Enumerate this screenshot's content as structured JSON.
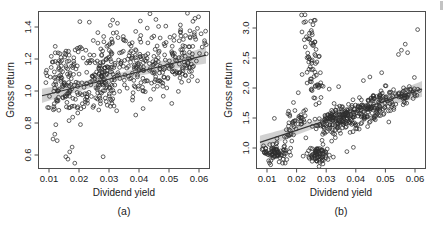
{
  "figure": {
    "title": "",
    "background_color": "#ffffff",
    "point_color": "#2e2e2e",
    "line_color": "#333333",
    "band_color": "#9a9a9a"
  },
  "chart_data": [
    {
      "type": "scatter",
      "panel": "a",
      "caption": "(a)",
      "title": "",
      "xlabel": "Dividend yield",
      "ylabel": "Gross return",
      "xlim": [
        0.0085,
        0.0655
      ],
      "ylim": [
        0.53,
        1.5
      ],
      "xticks": [
        0.01,
        0.02,
        0.03,
        0.04,
        0.05,
        0.06
      ],
      "xticklabels": [
        "0.01",
        "0.02",
        "0.03",
        "0.04",
        "0.05",
        "0.06"
      ],
      "yticks": [
        0.6,
        0.8,
        1.0,
        1.2,
        1.4
      ],
      "yticklabels": [
        "0.6",
        "0.8",
        "1.0",
        "1.2",
        "1.4"
      ],
      "grid": false,
      "legend": "none",
      "fit": {
        "type": "linear-regression",
        "intercept": 0.935,
        "slope": 4.6,
        "x_start": 0.0095,
        "x_end": 0.0645,
        "y_start": 0.979,
        "y_end": 1.232,
        "ci_halfwidth_start": 0.022,
        "ci_halfwidth_end": 0.052
      },
      "n_points": 520,
      "x": [
        0.0108,
        0.0112,
        0.0115,
        0.0118,
        0.0121,
        0.0124,
        0.0126,
        0.0128,
        0.0131,
        0.0133,
        0.0135,
        0.0137,
        0.0139,
        0.0141,
        0.0143,
        0.0145,
        0.0147,
        0.0149,
        0.0151,
        0.0153,
        0.0155,
        0.0157,
        0.0159,
        0.0161,
        0.0163,
        0.0165,
        0.0167,
        0.0169,
        0.0171,
        0.0173,
        0.0175,
        0.0176,
        0.0178,
        0.018,
        0.0182,
        0.0184,
        0.0186,
        0.0188,
        0.019,
        0.0192,
        0.0194,
        0.0196,
        0.0198,
        0.02,
        0.0202,
        0.0204,
        0.0206,
        0.0208,
        0.021,
        0.0212,
        0.0214,
        0.0216,
        0.0218,
        0.022,
        0.0222,
        0.0224,
        0.0226,
        0.0228,
        0.023,
        0.0232,
        0.0234,
        0.0236,
        0.0238,
        0.024,
        0.0242,
        0.0244,
        0.0246,
        0.0248,
        0.025,
        0.0252,
        0.0254,
        0.0256,
        0.0258,
        0.026,
        0.0262,
        0.0264,
        0.0266,
        0.0268,
        0.027,
        0.0272,
        0.0274,
        0.0276,
        0.0278,
        0.028,
        0.0282,
        0.0284,
        0.0286,
        0.0288,
        0.029,
        0.0292,
        0.0294,
        0.0296,
        0.0298,
        0.03,
        0.0302,
        0.0304,
        0.0306,
        0.0308,
        0.031,
        0.0312,
        0.0314,
        0.0316,
        0.0318,
        0.032,
        0.0322,
        0.0324,
        0.0326,
        0.0328,
        0.033,
        0.0332,
        0.0334,
        0.0336,
        0.0338,
        0.034,
        0.0342,
        0.0344,
        0.0346,
        0.0348,
        0.035,
        0.0352,
        0.0354,
        0.0356,
        0.0358,
        0.036,
        0.0362,
        0.0364,
        0.0366,
        0.0368,
        0.037,
        0.0372,
        0.0374,
        0.0376,
        0.0378,
        0.038,
        0.0383,
        0.0386,
        0.0389,
        0.0392,
        0.0395,
        0.0398,
        0.0401,
        0.0404,
        0.0407,
        0.041,
        0.0413,
        0.0416,
        0.0419,
        0.0422,
        0.0425,
        0.0428,
        0.0431,
        0.0434,
        0.0437,
        0.044,
        0.0443,
        0.0446,
        0.0449,
        0.0452,
        0.0455,
        0.0458,
        0.0461,
        0.0464,
        0.0467,
        0.047,
        0.0473,
        0.0476,
        0.0479,
        0.0482,
        0.0485,
        0.0488,
        0.0491,
        0.0494,
        0.0497,
        0.05,
        0.0504,
        0.0508,
        0.0512,
        0.0516,
        0.052,
        0.0524,
        0.0528,
        0.0532,
        0.0536,
        0.054,
        0.0544,
        0.0548,
        0.0552,
        0.0556,
        0.056,
        0.0564,
        0.0568,
        0.0572,
        0.0576,
        0.058,
        0.0584,
        0.0588,
        0.0592,
        0.0596,
        0.06,
        0.0604,
        0.0608,
        0.0612,
        0.0616,
        0.062
      ],
      "y": [
        1.02,
        0.95,
        1.11,
        0.88,
        1.2,
        1.04,
        0.93,
        1.15,
        1.08,
        0.86,
        1.23,
        0.99,
        1.12,
        0.78,
        1.06,
        1.18,
        0.91,
        1.02,
        1.27,
        0.84,
        1.09,
        1.14,
        0.97,
        1.21,
        0.88,
        1.05,
        1.3,
        0.93,
        1.16,
        1.01,
        0.82,
        1.24,
        1.08,
        0.95,
        1.12,
        1.19,
        0.87,
        1.03,
        1.26,
        0.9,
        1.15,
        1.07,
        0.98,
        1.22,
        0.85,
        1.1,
        1.32,
        0.94,
        1.17,
        1.0,
        0.8,
        1.25,
        1.06,
        0.92,
        1.13,
        1.2,
        0.89,
        1.04,
        1.28,
        0.96,
        1.18,
        1.02,
        0.83,
        1.23,
        1.09,
        0.91,
        1.14,
        1.21,
        0.87,
        1.05,
        1.29,
        0.93,
        1.16,
        1.0,
        0.78,
        1.24,
        1.07,
        0.9,
        1.12,
        1.19,
        0.86,
        1.03,
        1.27,
        0.95,
        1.15,
        1.01,
        0.82,
        1.22,
        1.08,
        0.94,
        1.13,
        1.2,
        0.88,
        1.06,
        1.3,
        0.92,
        1.17,
        1.04,
        0.81,
        1.25,
        1.1,
        0.96,
        1.14,
        1.21,
        0.9,
        1.07,
        1.28,
        0.93,
        1.18,
        1.02,
        0.84,
        1.23,
        1.09,
        0.95,
        1.15,
        1.22,
        0.89,
        1.05,
        1.31,
        0.94,
        1.19,
        1.03,
        0.85,
        1.26,
        1.11,
        0.97,
        1.16,
        1.23,
        0.91,
        1.08,
        1.29,
        0.96,
        1.2,
        1.05,
        0.87,
        1.27,
        1.12,
        0.99,
        1.18,
        1.24,
        0.93,
        1.1,
        1.32,
        0.98,
        1.21,
        1.07,
        0.89,
        1.28,
        1.14,
        1.0,
        1.19,
        1.25,
        0.95,
        1.11,
        1.33,
        1.0,
        1.22,
        1.09,
        0.91,
        1.3,
        1.15,
        1.02,
        1.2,
        1.26,
        0.97,
        1.13,
        1.35,
        1.02,
        1.24,
        1.1,
        0.93,
        1.31,
        1.17,
        1.04,
        1.22,
        1.28,
        0.99,
        1.15,
        1.36,
        1.04,
        1.26,
        1.12,
        0.95,
        1.33,
        1.19,
        1.06,
        1.24,
        1.3,
        1.01,
        1.17,
        1.38,
        1.06,
        1.28,
        1.14,
        0.97,
        1.35,
        1.21,
        1.08,
        1.26,
        1.32,
        1.03,
        1.19,
        1.4,
        1.09,
        1.3,
        1.16,
        1.0,
        1.37,
        1.23,
        1.11,
        1.28,
        1.34,
        1.06,
        1.21,
        1.43,
        1.12
      ]
    },
    {
      "type": "scatter",
      "panel": "b",
      "caption": "(b)",
      "title": "",
      "xlabel": "Dividend yield",
      "ylabel": "Gross return",
      "xlim": [
        0.0085,
        0.0655
      ],
      "ylim": [
        0.68,
        3.25
      ],
      "xticks": [
        0.01,
        0.02,
        0.03,
        0.04,
        0.05,
        0.06
      ],
      "xticklabels": [
        "0.01",
        "0.02",
        "0.03",
        "0.04",
        "0.05",
        "0.06"
      ],
      "yticks": [
        1.0,
        1.5,
        2.0,
        2.5,
        3.0
      ],
      "yticklabels": [
        "1.0",
        "1.5",
        "2.0",
        "2.5",
        "3.0"
      ],
      "grid": false,
      "legend": "none",
      "fit": {
        "type": "linear-regression",
        "intercept": 0.95,
        "slope": 16.0,
        "x_start": 0.0095,
        "x_end": 0.0645,
        "y_start": 1.102,
        "y_end": 1.982,
        "ci_halfwidth_start": 0.06,
        "ci_halfwidth_end": 0.13
      },
      "n_points": 460,
      "x": [
        0.0108,
        0.0112,
        0.0116,
        0.012,
        0.0124,
        0.0128,
        0.0132,
        0.0136,
        0.014,
        0.0144,
        0.0148,
        0.0152,
        0.0156,
        0.016,
        0.0164,
        0.0168,
        0.0172,
        0.0176,
        0.018,
        0.0184,
        0.0188,
        0.0192,
        0.0196,
        0.02,
        0.0204,
        0.0208,
        0.0212,
        0.0216,
        0.022,
        0.0224,
        0.0228,
        0.0232,
        0.0236,
        0.024,
        0.0244,
        0.0248,
        0.0252,
        0.0256,
        0.026,
        0.0264,
        0.0268,
        0.0272,
        0.0274,
        0.0276,
        0.0278,
        0.028,
        0.0282,
        0.0284,
        0.0286,
        0.0288,
        0.029,
        0.0292,
        0.0294,
        0.0296,
        0.0298,
        0.03,
        0.0302,
        0.0304,
        0.0306,
        0.0308,
        0.031,
        0.0312,
        0.0314,
        0.0316,
        0.0318,
        0.032,
        0.0324,
        0.0328,
        0.0332,
        0.0336,
        0.034,
        0.0344,
        0.0348,
        0.0352,
        0.0356,
        0.036,
        0.0364,
        0.0368,
        0.0372,
        0.0376,
        0.038,
        0.0384,
        0.0388,
        0.0392,
        0.0396,
        0.04,
        0.0404,
        0.0408,
        0.0412,
        0.0416,
        0.042,
        0.0424,
        0.0428,
        0.0432,
        0.0436,
        0.044,
        0.0444,
        0.0448,
        0.0452,
        0.0456,
        0.046,
        0.0464,
        0.0468,
        0.0472,
        0.0476,
        0.048,
        0.0484,
        0.0488,
        0.0492,
        0.0496,
        0.05,
        0.0505,
        0.051,
        0.0515,
        0.052,
        0.0525,
        0.053,
        0.0535,
        0.054,
        0.0545,
        0.055,
        0.0555,
        0.056,
        0.0565,
        0.057,
        0.0575,
        0.058,
        0.0585,
        0.059,
        0.0595,
        0.06,
        0.0605,
        0.061,
        0.0615,
        0.062,
        0.0625,
        0.063
      ],
      "y": [
        0.95,
        0.88,
        1.02,
        0.92,
        0.85,
        0.98,
        1.05,
        0.9,
        0.96,
        1.1,
        0.87,
        0.93,
        1.0,
        1.08,
        0.89,
        0.95,
        1.15,
        0.91,
        1.35,
        1.45,
        1.55,
        1.38,
        1.62,
        1.5,
        1.72,
        1.85,
        2.05,
        1.95,
        2.2,
        1.48,
        2.35,
        1.6,
        2.5,
        2.3,
        1.55,
        2.65,
        1.7,
        2.75,
        2.45,
        2.9,
        2.6,
        3.1,
        2.8,
        3.15,
        2.95,
        2.7,
        1.4,
        1.25,
        1.32,
        1.18,
        1.45,
        1.3,
        1.22,
        1.5,
        1.38,
        1.28,
        1.55,
        1.42,
        1.35,
        1.6,
        1.48,
        1.4,
        1.3,
        1.52,
        1.45,
        1.58,
        1.5,
        1.62,
        1.55,
        1.48,
        1.65,
        1.58,
        1.52,
        1.7,
        1.6,
        1.55,
        1.72,
        1.65,
        1.58,
        1.75,
        1.68,
        1.6,
        1.78,
        1.7,
        1.62,
        1.8,
        1.72,
        1.65,
        1.82,
        1.75,
        1.68,
        1.85,
        1.78,
        1.7,
        1.88,
        1.8,
        1.72,
        1.9,
        1.82,
        1.75,
        1.92,
        1.85,
        1.78,
        1.95,
        1.88,
        1.8,
        1.98,
        1.9,
        1.82,
        2.0,
        1.92,
        1.85,
        2.02,
        1.95,
        1.88,
        2.05,
        1.98,
        1.9,
        2.08,
        2.0,
        1.92,
        2.1,
        2.02,
        1.95,
        2.12,
        2.05,
        1.98,
        2.15,
        2.08,
        2.0,
        2.18,
        2.1,
        2.55,
        2.72,
        2.6,
        2.95,
        2.8
      ]
    }
  ]
}
